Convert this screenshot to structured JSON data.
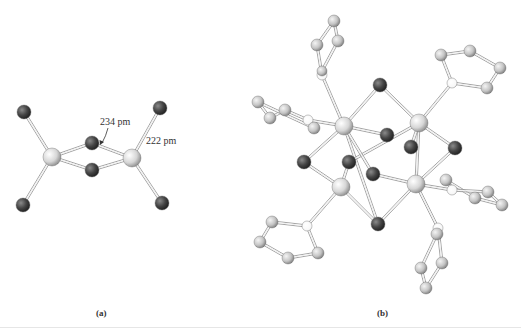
{
  "figure": {
    "panels": [
      {
        "id": "a",
        "caption": "(a)",
        "annotations": {
          "bond_bridge": "234 pm",
          "bond_terminal": "222 pm"
        },
        "atoms": [
          {
            "x": 52,
            "y": 157,
            "r": 9,
            "type": "metal"
          },
          {
            "x": 132,
            "y": 158,
            "r": 9,
            "type": "metal"
          },
          {
            "x": 92,
            "y": 143,
            "r": 7,
            "type": "halide"
          },
          {
            "x": 92,
            "y": 170,
            "r": 7,
            "type": "halide"
          },
          {
            "x": 24,
            "y": 112,
            "r": 7,
            "type": "halide"
          },
          {
            "x": 160,
            "y": 108,
            "r": 7,
            "type": "halide"
          },
          {
            "x": 23,
            "y": 205,
            "r": 7,
            "type": "halide"
          },
          {
            "x": 162,
            "y": 203,
            "r": 7,
            "type": "halide"
          }
        ],
        "bonds": [
          [
            0,
            2
          ],
          [
            0,
            3
          ],
          [
            1,
            2
          ],
          [
            1,
            3
          ],
          [
            0,
            4
          ],
          [
            0,
            6
          ],
          [
            1,
            5
          ],
          [
            1,
            7
          ]
        ]
      },
      {
        "id": "b",
        "caption": "(b)",
        "atoms": [
          {
            "x": 344,
            "y": 126,
            "r": 9,
            "type": "metal"
          },
          {
            "x": 419,
            "y": 123,
            "r": 9,
            "type": "metal"
          },
          {
            "x": 341,
            "y": 187,
            "r": 9,
            "type": "metal"
          },
          {
            "x": 416,
            "y": 184,
            "r": 9,
            "type": "metal"
          },
          {
            "x": 380,
            "y": 85,
            "r": 7,
            "type": "halide"
          },
          {
            "x": 387,
            "y": 135,
            "r": 7,
            "type": "halide"
          },
          {
            "x": 411,
            "y": 147,
            "r": 7,
            "type": "halide"
          },
          {
            "x": 455,
            "y": 148,
            "r": 7,
            "type": "halide"
          },
          {
            "x": 304,
            "y": 162,
            "r": 7,
            "type": "halide"
          },
          {
            "x": 349,
            "y": 162,
            "r": 7,
            "type": "halide"
          },
          {
            "x": 373,
            "y": 174,
            "r": 7,
            "type": "halide"
          },
          {
            "x": 378,
            "y": 224,
            "r": 7,
            "type": "halide"
          },
          {
            "x": 322,
            "y": 75,
            "r": 5,
            "type": "donor"
          },
          {
            "x": 322,
            "y": 71,
            "r": 5,
            "type": "carbon"
          },
          {
            "x": 317,
            "y": 45,
            "r": 6,
            "type": "carbon"
          },
          {
            "x": 334,
            "y": 21,
            "r": 6,
            "type": "carbon"
          },
          {
            "x": 338,
            "y": 41,
            "r": 6,
            "type": "carbon"
          },
          {
            "x": 452,
            "y": 83,
            "r": 5,
            "type": "donor"
          },
          {
            "x": 441,
            "y": 55,
            "r": 6,
            "type": "carbon"
          },
          {
            "x": 470,
            "y": 51,
            "r": 6,
            "type": "carbon"
          },
          {
            "x": 500,
            "y": 68,
            "r": 6,
            "type": "carbon"
          },
          {
            "x": 487,
            "y": 88,
            "r": 6,
            "type": "carbon"
          },
          {
            "x": 308,
            "y": 120,
            "r": 5,
            "type": "donor"
          },
          {
            "x": 314,
            "y": 128,
            "r": 6,
            "type": "carbon"
          },
          {
            "x": 285,
            "y": 110,
            "r": 6,
            "type": "carbon"
          },
          {
            "x": 270,
            "y": 118,
            "r": 6,
            "type": "carbon"
          },
          {
            "x": 258,
            "y": 102,
            "r": 6,
            "type": "carbon"
          },
          {
            "x": 307,
            "y": 226,
            "r": 5,
            "type": "donor"
          },
          {
            "x": 272,
            "y": 222,
            "r": 6,
            "type": "carbon"
          },
          {
            "x": 260,
            "y": 242,
            "r": 6,
            "type": "carbon"
          },
          {
            "x": 288,
            "y": 258,
            "r": 6,
            "type": "carbon"
          },
          {
            "x": 318,
            "y": 253,
            "r": 6,
            "type": "carbon"
          },
          {
            "x": 452,
            "y": 190,
            "r": 5,
            "type": "donor"
          },
          {
            "x": 446,
            "y": 180,
            "r": 6,
            "type": "carbon"
          },
          {
            "x": 488,
            "y": 192,
            "r": 6,
            "type": "carbon"
          },
          {
            "x": 475,
            "y": 198,
            "r": 6,
            "type": "carbon"
          },
          {
            "x": 502,
            "y": 205,
            "r": 6,
            "type": "carbon"
          },
          {
            "x": 438,
            "y": 228,
            "r": 5,
            "type": "donor"
          },
          {
            "x": 437,
            "y": 234,
            "r": 6,
            "type": "carbon"
          },
          {
            "x": 442,
            "y": 263,
            "r": 6,
            "type": "carbon"
          },
          {
            "x": 421,
            "y": 268,
            "r": 6,
            "type": "carbon"
          },
          {
            "x": 426,
            "y": 288,
            "r": 6,
            "type": "carbon"
          }
        ],
        "bonds": [
          [
            0,
            4
          ],
          [
            1,
            4
          ],
          [
            0,
            5
          ],
          [
            0,
            8
          ],
          [
            0,
            11
          ],
          [
            1,
            6
          ],
          [
            1,
            7
          ],
          [
            1,
            9
          ],
          [
            2,
            8
          ],
          [
            2,
            9
          ],
          [
            2,
            11
          ],
          [
            3,
            10
          ],
          [
            3,
            11
          ],
          [
            3,
            7
          ],
          [
            0,
            10
          ],
          [
            1,
            3
          ],
          [
            0,
            12
          ],
          [
            12,
            14
          ],
          [
            14,
            15
          ],
          [
            15,
            16
          ],
          [
            16,
            13
          ],
          [
            1,
            17
          ],
          [
            17,
            18
          ],
          [
            18,
            19
          ],
          [
            19,
            20
          ],
          [
            20,
            21
          ],
          [
            21,
            17
          ],
          [
            0,
            22
          ],
          [
            22,
            24
          ],
          [
            24,
            25
          ],
          [
            25,
            26
          ],
          [
            26,
            23
          ],
          [
            23,
            22
          ],
          [
            2,
            27
          ],
          [
            27,
            28
          ],
          [
            28,
            29
          ],
          [
            29,
            30
          ],
          [
            30,
            31
          ],
          [
            31,
            27
          ],
          [
            3,
            32
          ],
          [
            32,
            33
          ],
          [
            33,
            35
          ],
          [
            32,
            34
          ],
          [
            34,
            36
          ],
          [
            35,
            36
          ],
          [
            3,
            37
          ],
          [
            37,
            38
          ],
          [
            38,
            40
          ],
          [
            40,
            41
          ],
          [
            41,
            39
          ],
          [
            39,
            37
          ]
        ]
      }
    ]
  },
  "colors": {
    "metal": "#d8d8d8",
    "halide": "#3c3c3c",
    "carbon": "#c4c4c4",
    "donor": "#ffffff",
    "bond": "#9a9a9a"
  }
}
